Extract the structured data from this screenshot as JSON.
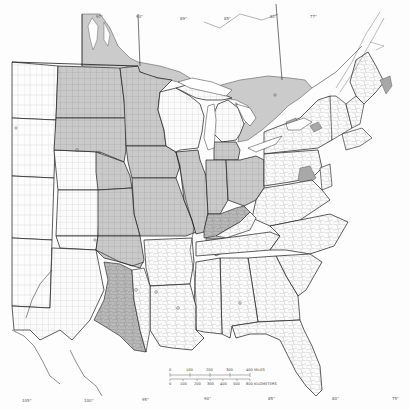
{
  "map": {
    "type": "thematic-choropleth",
    "region": "Eastern United States and southern Canada",
    "colors": {
      "background": "#fdfdfd",
      "shaded_region": "#c9c9c9",
      "dark_shaded": "#9e9e9e",
      "state_border": "#1a1a1a",
      "county_border": "#7a7a7a",
      "water": "#ffffff"
    },
    "longitude_labels_top": [
      "97°",
      "93°",
      "89°",
      "85°",
      "81°",
      "77°"
    ],
    "longitude_labels_bottom": [
      "105°",
      "100°",
      "95°",
      "90°",
      "85°",
      "80°",
      "75°"
    ],
    "scale_bar": {
      "miles_ticks": [
        "0",
        "100",
        "200",
        "300",
        "400 MILES"
      ],
      "km_ticks": [
        "0",
        "100",
        "200",
        "300",
        "400",
        "500",
        "600 KILOMETERS"
      ]
    },
    "shaded_areas": [
      "Manitoba / Ontario lowlands north of Minnesota",
      "North Dakota, Minnesota, eastern South Dakota",
      "Iowa, Missouri, eastern Nebraska, eastern Kansas",
      "Illinois, Indiana, Ohio (southern Michigan)",
      "Southern Ontario peninsula",
      "Bluegrass Kentucky / Nashville basin",
      "Eastern Oklahoma and north-central Texas blackland prairie",
      "Isolated patches in New York, Pennsylvania, Maine"
    ]
  }
}
